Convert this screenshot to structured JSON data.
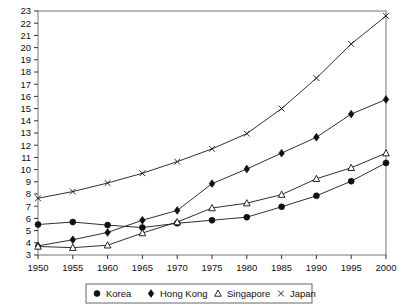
{
  "chart_data": {
    "type": "line",
    "title": "",
    "subtitle": "",
    "xlabel": "",
    "ylabel": "",
    "xlim": [
      1950,
      2000
    ],
    "ylim": [
      3,
      23
    ],
    "grid": false,
    "legend_position": "bottom-center",
    "x": [
      1950,
      1955,
      1960,
      1965,
      1970,
      1975,
      1980,
      1985,
      1990,
      1995,
      2000
    ],
    "xtick_labels": [
      "1950",
      "1955",
      "1960",
      "1965",
      "1970",
      "1975",
      "1980",
      "1985",
      "1990",
      "1995",
      "2000"
    ],
    "ytick_labels": [
      "3",
      "4",
      "5",
      "6",
      "7",
      "8",
      "9",
      "10",
      "11",
      "12",
      "13",
      "14",
      "15",
      "16",
      "17",
      "18",
      "19",
      "20",
      "21",
      "22",
      "23"
    ],
    "yticks": [
      3,
      4,
      5,
      6,
      7,
      8,
      9,
      10,
      11,
      12,
      13,
      14,
      15,
      16,
      17,
      18,
      19,
      20,
      21,
      22,
      23
    ],
    "series": [
      {
        "name": "Korea",
        "marker": "filled-circle",
        "values": [
          5.5,
          5.7,
          5.45,
          5.25,
          5.6,
          5.85,
          6.1,
          6.95,
          7.85,
          9.05,
          10.55
        ]
      },
      {
        "name": "Hong Kong",
        "marker": "filled-diamond",
        "values": [
          3.75,
          4.25,
          4.85,
          5.85,
          6.65,
          8.85,
          10.05,
          11.35,
          12.65,
          14.55,
          15.75
        ]
      },
      {
        "name": "Singapore",
        "marker": "open-triangle",
        "values": [
          3.7,
          3.6,
          3.8,
          4.8,
          5.7,
          6.85,
          7.25,
          7.95,
          9.25,
          10.15,
          11.35
        ]
      },
      {
        "name": "Japan",
        "marker": "cross",
        "values": [
          7.65,
          8.2,
          8.9,
          9.7,
          10.65,
          11.7,
          12.95,
          15.0,
          17.5,
          20.3,
          22.6
        ]
      }
    ]
  },
  "legend": {
    "entries": [
      {
        "label": "Korea",
        "marker": "filled-circle"
      },
      {
        "label": "Hong Kong",
        "marker": "filled-diamond"
      },
      {
        "label": "Singapore",
        "marker": "open-triangle"
      },
      {
        "label": "Japan",
        "marker": "cross"
      }
    ]
  },
  "colors": {
    "ink": "#111111",
    "frame": "#777777",
    "background": "#ffffff"
  }
}
